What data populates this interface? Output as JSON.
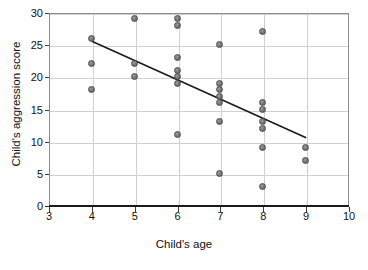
{
  "chart_data": {
    "type": "scatter",
    "title": "",
    "xlabel": "Child's age",
    "ylabel": "Child's aggression score",
    "xlim": [
      3,
      10
    ],
    "ylim": [
      0,
      30
    ],
    "xticks": [
      3,
      4,
      5,
      6,
      7,
      8,
      9,
      10
    ],
    "yticks": [
      0,
      5,
      10,
      15,
      20,
      25,
      30
    ],
    "xtick_labels": [
      "3",
      "4",
      "5",
      "6",
      "7",
      "8",
      "9",
      "10"
    ],
    "ytick_labels": [
      "0",
      "5",
      "10",
      "15",
      "20",
      "25",
      "30"
    ],
    "grid": true,
    "legend": "none",
    "marker_color": "#7d7d7d",
    "marker_edge_color": "#4a4a4a",
    "grid_color": "#d0d0d0",
    "axis_color": "#1a1a1a",
    "trendline_color": "#1a1a1a",
    "points": [
      {
        "x": 4,
        "y": 26
      },
      {
        "x": 4,
        "y": 22
      },
      {
        "x": 4,
        "y": 18
      },
      {
        "x": 5,
        "y": 29
      },
      {
        "x": 5,
        "y": 22
      },
      {
        "x": 5,
        "y": 20
      },
      {
        "x": 6,
        "y": 29
      },
      {
        "x": 6,
        "y": 28
      },
      {
        "x": 6,
        "y": 23
      },
      {
        "x": 6,
        "y": 21
      },
      {
        "x": 6,
        "y": 20
      },
      {
        "x": 6,
        "y": 19
      },
      {
        "x": 6,
        "y": 11
      },
      {
        "x": 7,
        "y": 25
      },
      {
        "x": 7,
        "y": 19
      },
      {
        "x": 7,
        "y": 18
      },
      {
        "x": 7,
        "y": 17
      },
      {
        "x": 7,
        "y": 16
      },
      {
        "x": 7,
        "y": 13
      },
      {
        "x": 7,
        "y": 5
      },
      {
        "x": 8,
        "y": 27
      },
      {
        "x": 8,
        "y": 16
      },
      {
        "x": 8,
        "y": 15
      },
      {
        "x": 8,
        "y": 13
      },
      {
        "x": 8,
        "y": 12
      },
      {
        "x": 8,
        "y": 9
      },
      {
        "x": 8,
        "y": 3
      },
      {
        "x": 9,
        "y": 9
      },
      {
        "x": 9,
        "y": 7
      }
    ],
    "trendline": {
      "x0": 4,
      "y0": 25.6,
      "x1": 9,
      "y1": 10.6
    }
  }
}
